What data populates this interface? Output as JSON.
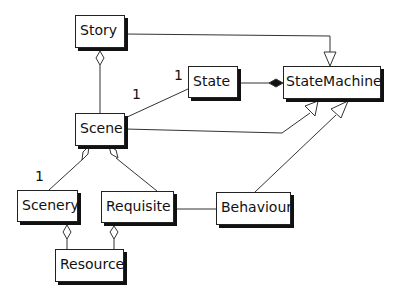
{
  "diagram": {
    "type": "UML class diagram",
    "classes": {
      "story": "Story",
      "state": "State",
      "state_machine": "StateMachine",
      "scene": "Scene",
      "scenery": "Scenery",
      "requisite": "Requisite",
      "behaviour": "Behaviour",
      "resource": "Resource"
    },
    "multiplicities": {
      "state_end": "1",
      "scene_state_end": "1",
      "scenery_end": "1"
    },
    "relationships": [
      {
        "from": "Story",
        "to": "StateMachine",
        "kind": "generalization"
      },
      {
        "from": "Scene",
        "to": "StateMachine",
        "kind": "generalization"
      },
      {
        "from": "Behaviour",
        "to": "StateMachine",
        "kind": "generalization"
      },
      {
        "from": "State",
        "to": "StateMachine",
        "kind": "composition"
      },
      {
        "from": "Scene",
        "to": "Story",
        "kind": "aggregation"
      },
      {
        "from": "Scene",
        "to": "State",
        "kind": "association"
      },
      {
        "from": "Scenery",
        "to": "Scene",
        "kind": "aggregation"
      },
      {
        "from": "Requisite",
        "to": "Scene",
        "kind": "aggregation"
      },
      {
        "from": "Requisite",
        "to": "Behaviour",
        "kind": "association"
      },
      {
        "from": "Resource",
        "to": "Scenery",
        "kind": "aggregation"
      },
      {
        "from": "Resource",
        "to": "Requisite",
        "kind": "aggregation"
      }
    ]
  }
}
